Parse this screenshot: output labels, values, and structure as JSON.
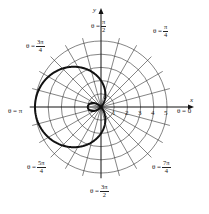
{
  "figure": {
    "center": [
      101,
      107
    ],
    "unit_px": 13.2,
    "grid": {
      "circle_radii": [
        1,
        2,
        3,
        4,
        5
      ],
      "ray_step_deg": 15,
      "ray_extent": 5.4,
      "grid_color": "#333333",
      "curve_color": "#111111"
    },
    "axes": {
      "x_label": "x",
      "y_label": "y"
    },
    "ticks": [
      "1",
      "2",
      "3",
      "4",
      "5"
    ],
    "angle_labels": {
      "a0": {
        "prefix": "θ =",
        "value": "0"
      },
      "a45": {
        "prefix": "θ =",
        "num": "π",
        "den": "4"
      },
      "a90": {
        "prefix": "θ =",
        "num": "π",
        "den": "2"
      },
      "a135": {
        "prefix": "θ =",
        "num": "3π",
        "den": "4"
      },
      "a180": {
        "prefix": "θ =",
        "value": "π"
      },
      "a225": {
        "prefix": "θ =",
        "num": "5π",
        "den": "4"
      },
      "a270": {
        "prefix": "θ =",
        "num": "3π",
        "den": "2"
      },
      "a315": {
        "prefix": "θ =",
        "num": "7π",
        "den": "4"
      }
    }
  },
  "chart_data": {
    "type": "polar-curve",
    "title": "",
    "equation": "r = 2 - 3cos(θ)",
    "curve_params": {
      "a": 2,
      "b": -3
    },
    "r_ticks": [
      1,
      2,
      3,
      4,
      5
    ],
    "r_range": [
      0,
      5
    ],
    "theta_labels": [
      "0",
      "π/4",
      "π/2",
      "3π/4",
      "π",
      "5π/4",
      "3π/2",
      "7π/4"
    ],
    "key_points": [
      {
        "theta": "0",
        "r": -1
      },
      {
        "theta": "π/2",
        "r": 2
      },
      {
        "theta": "π",
        "r": 5
      },
      {
        "theta": "3π/2",
        "r": 2
      }
    ],
    "xlabel": "x",
    "ylabel": "y",
    "grid": true
  }
}
